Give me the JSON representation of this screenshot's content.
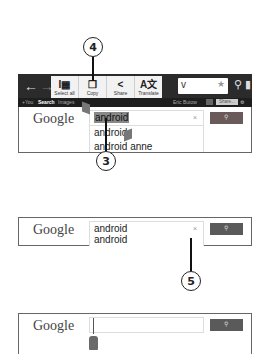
{
  "callouts": [
    {
      "number": "4"
    },
    {
      "number": "3"
    },
    {
      "number": "5"
    }
  ],
  "browser": {
    "back_icon": "←",
    "forward_icon": "→",
    "url_text": "v",
    "bookmark_star": "★",
    "search_icon": "⚲",
    "bookmarks_icon": "▮"
  },
  "context_menu": {
    "items": [
      {
        "label": "Select all",
        "glyph": "I▦"
      },
      {
        "label": "Copy",
        "glyph": "❐"
      },
      {
        "label": "Share",
        "glyph": "<"
      },
      {
        "label": "Translate",
        "glyph": "A文"
      }
    ]
  },
  "google_bar": {
    "links": [
      "+You",
      "Search",
      "Images"
    ],
    "user": "Eric Butow",
    "share_label": "Share...",
    "mic_icon": "🎤",
    "gear_icon": "⚙"
  },
  "panels": [
    {
      "logo": "Google",
      "query": "android",
      "suggestions": [
        "android",
        "android anne"
      ],
      "clear_icon": "×",
      "search_button_icon": "⚲"
    },
    {
      "logo": "Google",
      "query": "android",
      "suggestions": [
        "android"
      ],
      "clear_icon": "×",
      "search_button_icon": "⚲"
    },
    {
      "logo": "Google",
      "query": "",
      "search_button_icon": "⚲"
    }
  ]
}
